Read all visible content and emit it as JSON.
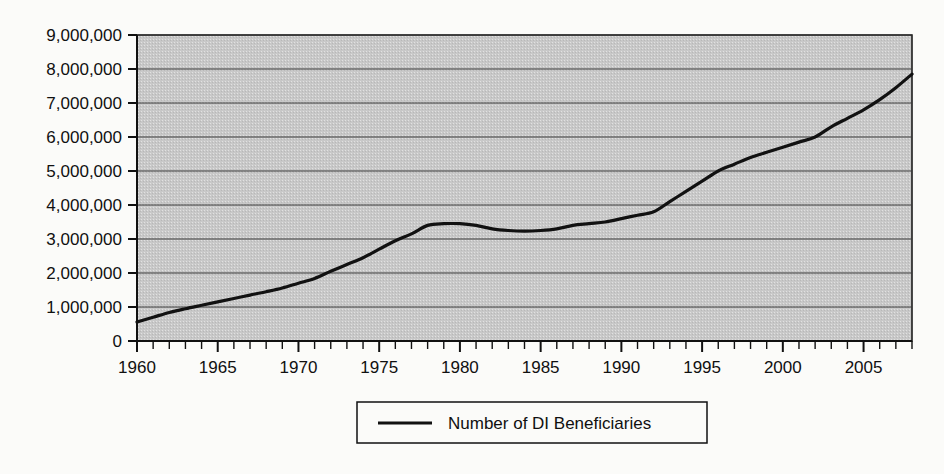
{
  "chart_data": {
    "type": "line",
    "title": "",
    "xlabel": "",
    "ylabel": "",
    "xlim": [
      1960,
      2008
    ],
    "ylim": [
      0,
      9000000
    ],
    "grid": true,
    "grid_axis": "y",
    "legend_position": "bottom-center",
    "plot_background": "#c8c8c8",
    "line_color": "#111111",
    "y_ticks": [
      0,
      1000000,
      2000000,
      3000000,
      4000000,
      5000000,
      6000000,
      7000000,
      8000000,
      9000000
    ],
    "y_tick_labels": [
      "0",
      "1,000,000",
      "2,000,000",
      "3,000,000",
      "4,000,000",
      "5,000,000",
      "6,000,000",
      "7,000,000",
      "8,000,000",
      "9,000,000"
    ],
    "x_ticks_labeled": [
      1960,
      1965,
      1970,
      1975,
      1980,
      1985,
      1990,
      1995,
      2000,
      2005
    ],
    "x_tick_labels": [
      "1960",
      "1965",
      "1970",
      "1975",
      "1980",
      "1985",
      "1990",
      "1995",
      "2000",
      "2005"
    ],
    "x_minor_tick_interval": 1,
    "series": [
      {
        "name": "Number of DI Beneficiaries",
        "x": [
          1960,
          1961,
          1962,
          1963,
          1964,
          1965,
          1966,
          1967,
          1968,
          1969,
          1970,
          1971,
          1972,
          1973,
          1974,
          1975,
          1976,
          1977,
          1978,
          1979,
          1980,
          1981,
          1982,
          1983,
          1984,
          1985,
          1986,
          1987,
          1988,
          1989,
          1990,
          1991,
          1992,
          1993,
          1994,
          1995,
          1996,
          1997,
          1998,
          1999,
          2000,
          2001,
          2002,
          2003,
          2004,
          2005,
          2006,
          2007,
          2008
        ],
        "values": [
          560000,
          700000,
          840000,
          950000,
          1050000,
          1150000,
          1250000,
          1350000,
          1450000,
          1560000,
          1700000,
          1840000,
          2050000,
          2250000,
          2450000,
          2700000,
          2950000,
          3150000,
          3400000,
          3450000,
          3450000,
          3400000,
          3300000,
          3250000,
          3230000,
          3250000,
          3300000,
          3400000,
          3450000,
          3500000,
          3600000,
          3700000,
          3800000,
          4100000,
          4400000,
          4700000,
          5000000,
          5200000,
          5400000,
          5550000,
          5700000,
          5850000,
          6000000,
          6300000,
          6550000,
          6800000,
          7100000,
          7450000,
          7850000
        ]
      }
    ]
  },
  "legend": {
    "entries": [
      {
        "label": "Number of DI Beneficiaries",
        "marker": "line-marker",
        "color": "#111111"
      }
    ]
  },
  "axes": {
    "y_axis_name": "y-axis",
    "x_axis_name": "x-axis"
  }
}
